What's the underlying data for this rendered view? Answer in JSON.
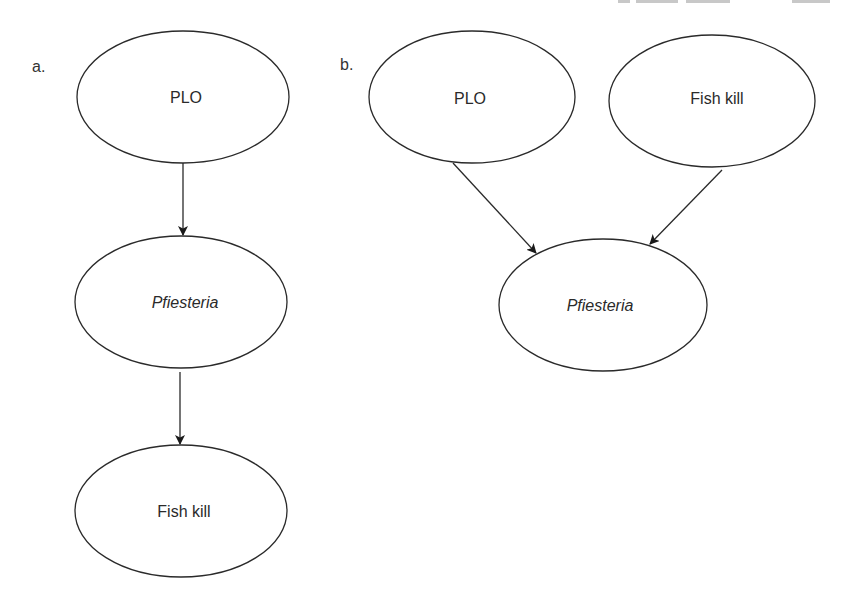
{
  "figure": {
    "header_clipped": true,
    "panels": [
      {
        "id": "a",
        "label": "a.",
        "nodes": [
          {
            "id": "plo",
            "label": "PLO",
            "italic": false
          },
          {
            "id": "pfiesteria",
            "label": "Pfiesteria",
            "italic": true
          },
          {
            "id": "fishkill",
            "label": "Fish kill",
            "italic": false
          }
        ],
        "edges": [
          {
            "from": "plo",
            "to": "pfiesteria"
          },
          {
            "from": "pfiesteria",
            "to": "fishkill"
          }
        ]
      },
      {
        "id": "b",
        "label": "b.",
        "nodes": [
          {
            "id": "plo",
            "label": "PLO",
            "italic": false
          },
          {
            "id": "fishkill",
            "label": "Fish kill",
            "italic": false
          },
          {
            "id": "pfiesteria",
            "label": "Pfiesteria",
            "italic": true
          }
        ],
        "edges": [
          {
            "from": "plo",
            "to": "pfiesteria"
          },
          {
            "from": "fishkill",
            "to": "pfiesteria"
          }
        ]
      }
    ],
    "colors": {
      "stroke": "#2a2a2a",
      "background": "#ffffff"
    }
  }
}
